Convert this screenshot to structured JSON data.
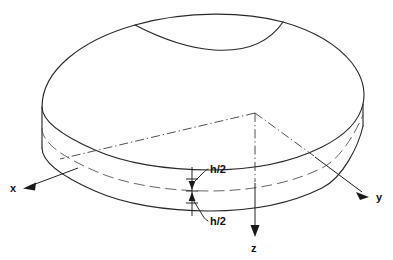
{
  "figure": {
    "background_color": "#ffffff",
    "line_color": "#2a2a2a",
    "labels": {
      "x_axis": "x",
      "y_axis": "y",
      "z_axis": "z",
      "thickness_upper": "h/2",
      "thickness_lower": "h/2"
    },
    "geometry": {
      "origin_px": [
        255,
        113
      ],
      "x_axis_tip_px": [
        24,
        187
      ],
      "y_axis_tip_px": [
        368,
        196
      ],
      "z_axis_tip_px": [
        255,
        236
      ],
      "plate_thickness_label": "h",
      "half_thickness_label": "h/2"
    },
    "line_styles": {
      "solid_outline": "solid",
      "midplane": "dashed",
      "hidden_axes": "dash-dot"
    }
  }
}
